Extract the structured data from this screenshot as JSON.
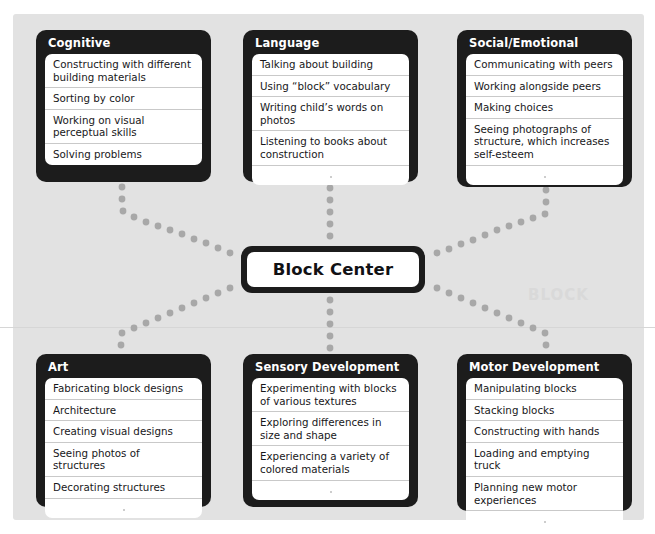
{
  "diagram": {
    "title": "Block Center",
    "center_label": "Block Center",
    "watermark": "BLOCK",
    "colors": {
      "card_frame": "#1c1c1c",
      "card_body": "#ffffff",
      "panel_background": "#e2e2e2",
      "page_background": "#ffffff",
      "connector_dot": "#a8a8a8",
      "row_divider": "#c9c9c9",
      "title_text": "#ffffff",
      "row_text": "#17171a"
    },
    "categories": [
      {
        "id": "cognitive",
        "title": "Cognitive",
        "position": "top-left",
        "items": [
          "Constructing with different building materials",
          "Sorting by color",
          "Working on visual perceptual skills",
          "Solving problems"
        ],
        "trailing_blank_rows": 0
      },
      {
        "id": "language",
        "title": "Language",
        "position": "top-center",
        "items": [
          "Talking about building",
          "Using “block” vocabulary",
          "Writing child’s words on photos",
          "Listening to books about construction"
        ],
        "trailing_blank_rows": 1
      },
      {
        "id": "social-emotional",
        "title": "Social/Emotional",
        "position": "top-right",
        "items": [
          "Communicating with peers",
          "Working alongside peers",
          "Making choices",
          "Seeing photographs of structure, which increases self-esteem"
        ],
        "trailing_blank_rows": 1
      },
      {
        "id": "art",
        "title": "Art",
        "position": "bottom-left",
        "items": [
          "Fabricating block designs",
          "Architecture",
          "Creating visual designs",
          "Seeing photos of structures",
          "Decorating structures"
        ],
        "trailing_blank_rows": 1
      },
      {
        "id": "sensory-development",
        "title": "Sensory Development",
        "position": "bottom-center",
        "items": [
          "Experimenting with blocks of various textures",
          "Exploring differences in size and shape",
          "Experiencing a variety of colored materials"
        ],
        "trailing_blank_rows": 1
      },
      {
        "id": "motor-development",
        "title": "Motor Development",
        "position": "bottom-right",
        "items": [
          "Manipulating blocks",
          "Stacking blocks",
          "Constructing with hands",
          "Loading and emptying truck",
          "Planning new motor experiences"
        ],
        "trailing_blank_rows": 1
      }
    ],
    "connectors": [
      {
        "from": "block-center",
        "to": "cognitive"
      },
      {
        "from": "block-center",
        "to": "language"
      },
      {
        "from": "block-center",
        "to": "social-emotional"
      },
      {
        "from": "block-center",
        "to": "art"
      },
      {
        "from": "block-center",
        "to": "sensory-development"
      },
      {
        "from": "block-center",
        "to": "motor-development"
      }
    ]
  },
  "layout": {
    "cards": {
      "cognitive": {
        "left": 36,
        "top": 30,
        "width": 175,
        "height": 152
      },
      "language": {
        "left": 243,
        "top": 30,
        "width": 175,
        "height": 152
      },
      "social-emotional": {
        "left": 457,
        "top": 30,
        "width": 175,
        "height": 157
      },
      "art": {
        "left": 36,
        "top": 354,
        "width": 175,
        "height": 153
      },
      "sensory-development": {
        "left": 243,
        "top": 354,
        "width": 175,
        "height": 153
      },
      "motor-development": {
        "left": 457,
        "top": 354,
        "width": 175,
        "height": 157
      }
    }
  }
}
